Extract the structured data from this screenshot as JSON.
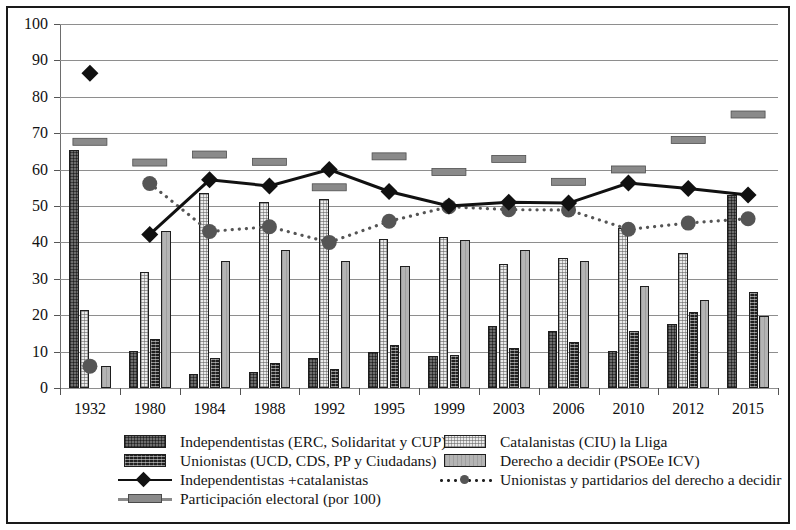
{
  "chart_data": {
    "type": "bar",
    "title": "",
    "subtitle": "",
    "xlabel": "",
    "ylabel": "",
    "ylim": [
      0,
      100
    ],
    "ytick_step": 10,
    "yticks": [
      0,
      10,
      20,
      30,
      40,
      50,
      60,
      70,
      80,
      90,
      100
    ],
    "grid": true,
    "legend_position": "bottom",
    "categories": [
      "1932",
      "1980",
      "1984",
      "1988",
      "1992",
      "1995",
      "1999",
      "2003",
      "2006",
      "2010",
      "2012",
      "2015"
    ],
    "series": [
      {
        "name": "Independentistas (ERC, Solidaritat y CUP)",
        "kind": "bar",
        "style": "dark-grey-checker",
        "color": "#6d6d6d",
        "values": [
          65.5,
          10.3,
          3.8,
          4.5,
          8.2,
          9.8,
          8.9,
          16.9,
          15.6,
          10.2,
          17.7,
          53.0
        ]
      },
      {
        "name": "Catalanistas (CIU) la Lliga",
        "kind": "bar",
        "style": "light-speckle",
        "color": "#ebebeb",
        "values": [
          21.5,
          31.8,
          53.5,
          51.0,
          51.8,
          41.0,
          41.5,
          34.0,
          35.8,
          44.0,
          37.0,
          null
        ]
      },
      {
        "name": "Unionistas (UCD, CDS, PP y Ciudadans)",
        "kind": "bar",
        "style": "black-dotted",
        "color": "#1f1f1f",
        "values": [
          null,
          13.5,
          8.2,
          6.8,
          5.2,
          11.8,
          9.0,
          11.0,
          12.6,
          15.6,
          20.8,
          26.3
        ]
      },
      {
        "name": "Derecho a decidir (PSOEe ICV)",
        "kind": "bar",
        "style": "mid-grey",
        "color": "#b4b4b4",
        "values": [
          6.0,
          43.0,
          34.9,
          37.8,
          34.8,
          33.5,
          40.8,
          37.8,
          35.0,
          28.0,
          24.2,
          19.8
        ]
      },
      {
        "name": "Independentistas +catalanistas",
        "kind": "line",
        "marker": "diamond",
        "color": "#111111",
        "values": [
          null,
          42.2,
          57.2,
          55.5,
          60.0,
          54.0,
          50.0,
          51.0,
          50.8,
          56.3,
          54.8,
          53.0
        ]
      },
      {
        "name": "Unionistas y partidarios del derecho a decidir",
        "kind": "dotted-line",
        "marker": "circle",
        "color": "#555555",
        "values": [
          6.0,
          56.2,
          43.0,
          44.3,
          40.0,
          45.8,
          49.8,
          49.0,
          48.9,
          43.6,
          45.3,
          46.5
        ]
      },
      {
        "name": "Participación electoral (por 100)",
        "kind": "marker-bar",
        "color": "#8a8a8a",
        "values": [
          67.5,
          61.8,
          64.0,
          62.0,
          55.0,
          63.5,
          59.2,
          62.8,
          56.5,
          59.9,
          68.0,
          75.0
        ]
      }
    ]
  },
  "legend": {
    "left": [
      {
        "label": "Independentistas (ERC, Solidaritat y CUP)",
        "key": "swatch-indep"
      },
      {
        "label": "Unionistas (UCD, CDS, PP y Ciudadans)",
        "key": "swatch-union"
      },
      {
        "label": "Independentistas +catalanistas",
        "key": "line-diamond"
      },
      {
        "label": "Participación electoral (por 100)",
        "key": "bar-grey"
      }
    ],
    "right": [
      {
        "label": "Catalanistas (CIU) la Lliga",
        "key": "swatch-catal"
      },
      {
        "label": "Derecho a decidir (PSOEe ICV)",
        "key": "swatch-decidir"
      },
      {
        "label": "Unionistas y partidarios del derecho a decidir",
        "key": "dotted-circle"
      }
    ]
  }
}
